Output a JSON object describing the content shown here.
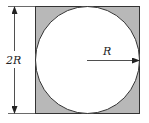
{
  "diagram": {
    "labels": {
      "side": "2R",
      "radius": "R"
    },
    "colors": {
      "square_fill": "#b8b8b8",
      "circle_fill": "#ffffff",
      "stroke": "#333333"
    }
  }
}
